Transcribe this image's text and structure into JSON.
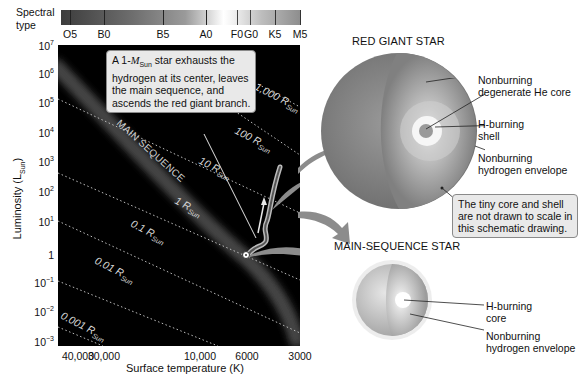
{
  "spectral": {
    "label_line1": "Spectral",
    "label_line2": "type",
    "types": [
      {
        "name": "O5",
        "x": 70
      },
      {
        "name": "B0",
        "x": 104
      },
      {
        "name": "B5",
        "x": 163
      },
      {
        "name": "A0",
        "x": 206
      },
      {
        "name": "F0",
        "x": 237
      },
      {
        "name": "G0",
        "x": 250
      },
      {
        "name": "K5",
        "x": 275
      },
      {
        "name": "M5",
        "x": 300
      }
    ]
  },
  "axes": {
    "y_label": "Luminosity (L",
    "y_label_sub": "Sun",
    "y_label_end": ")",
    "x_label": "Surface temperature (K)",
    "y_ticks": [
      {
        "base": "10",
        "exp": "7",
        "y": 47
      },
      {
        "base": "10",
        "exp": "6",
        "y": 75
      },
      {
        "base": "10",
        "exp": "5",
        "y": 104
      },
      {
        "base": "10",
        "exp": "4",
        "y": 134
      },
      {
        "base": "10",
        "exp": "3",
        "y": 163
      },
      {
        "base": "10",
        "exp": "2",
        "y": 193
      },
      {
        "base": "10",
        "exp": "1",
        "y": 223
      },
      {
        "base": "1",
        "exp": "",
        "y": 254
      },
      {
        "base": "10",
        "exp": "−1",
        "y": 284
      },
      {
        "base": "10",
        "exp": "−2",
        "y": 313
      },
      {
        "base": "10",
        "exp": "−3",
        "y": 343
      }
    ],
    "x_ticks": [
      {
        "label": "40,000",
        "x": 78
      },
      {
        "label": "30,000",
        "x": 98
      },
      {
        "label": "10,000",
        "x": 200
      },
      {
        "label": "6000",
        "x": 247
      },
      {
        "label": "3000",
        "x": 300
      }
    ]
  },
  "radius_lines": [
    {
      "label": "1,000 R",
      "sub": "Sun"
    },
    {
      "label": "100 R",
      "sub": "Sun"
    },
    {
      "label": "10 R",
      "sub": "Sun"
    },
    {
      "label": "1 R",
      "sub": "Sun"
    },
    {
      "label": "0.1 R",
      "sub": "Sun"
    },
    {
      "label": "0.01 R",
      "sub": "Sun"
    },
    {
      "label": "0.001 R",
      "sub": "Sun"
    }
  ],
  "main_sequence_label": "MAIN SEQUENCE",
  "callout_track": {
    "line1_a": "A 1-",
    "line1_m": "M",
    "line1_sub": "Sun",
    "line1_b": " star exhausts the",
    "line2": "hydrogen at its center, leaves",
    "line3": "the main sequence, and",
    "line4": "ascends the red giant branch."
  },
  "red_giant": {
    "title": "RED GIANT STAR",
    "labels": [
      {
        "line1": "Nonburning",
        "line2": "degenerate He core"
      },
      {
        "line1": "H-burning",
        "line2": "shell"
      },
      {
        "line1": "Nonburning",
        "line2": "hydrogen envelope"
      }
    ]
  },
  "scale_note": {
    "line1": "The tiny core and shell",
    "line2": "are not drawn to scale in",
    "line3": "this schematic drawing."
  },
  "main_sequence_star": {
    "title": "MAIN-SEQUENCE STAR",
    "labels": [
      {
        "line1": "H-burning",
        "line2": "core"
      },
      {
        "line1": "Nonburning",
        "line2": "hydrogen envelope"
      }
    ]
  },
  "colors": {
    "plot_bg": "#000000",
    "callout_bg": "#e9e9e9",
    "arrow": "#8c8c8c",
    "star_shell": "#8a8a8a"
  }
}
